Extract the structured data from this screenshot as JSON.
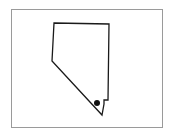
{
  "map": {
    "region": "Nevada",
    "style": "outline",
    "outline_color": "#1a1a1a",
    "frame_color": "#9a9a9a",
    "background": "#ffffff",
    "outline_points": [
      [
        54,
        23
      ],
      [
        109,
        24
      ],
      [
        108,
        100
      ],
      [
        104,
        100
      ],
      [
        104,
        104
      ],
      [
        102,
        115
      ],
      [
        52,
        61
      ]
    ],
    "marker": {
      "label": "",
      "x": 97,
      "y": 103,
      "radius": 3,
      "color": "#111111"
    }
  }
}
